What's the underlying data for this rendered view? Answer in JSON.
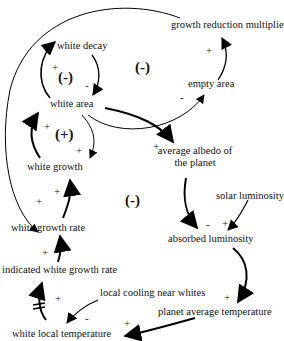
{
  "diagram": {
    "nodes": {
      "growth_reduction_multiplier": "growth reduction multiplier",
      "white_decay": "white decay",
      "empty_area": "empty area",
      "white_area": "white area",
      "average_albedo_line1": "average albedo of",
      "average_albedo_line2": "the planet",
      "white_growth": "white growth",
      "solar_luminosity": "solar luminosity",
      "white_growth_rate": "white growth rate",
      "absorbed_luminosity": "absorbed luminosity",
      "indicated_white_growth_rate": "indicated white growth rate",
      "local_cooling_near_whites": "local cooling near whites",
      "planet_average_temperature": "planet average temperature",
      "white_local_temperature": "white local temperature"
    },
    "loops": {
      "decay_loop": "(-)",
      "empty_area_loop": "(-)",
      "growth_loop": "(+)",
      "albedo_loop": "(-)"
    },
    "signs": {
      "decay_to_white_decay": "+",
      "white_decay_to_area": "-",
      "empty_to_multiplier": "+",
      "area_to_empty": "-",
      "growth_to_area": "+",
      "area_to_growth": "+",
      "area_to_albedo": "+",
      "rate_to_growth": "+",
      "multiplier_to_rate": "+",
      "albedo_to_absorbed": "-",
      "solar_to_absorbed": "+",
      "indicated_to_rate": "+",
      "temp_to_indicated": "+",
      "cooling_to_local": "-",
      "absorbed_to_planet_temp": "+",
      "planet_temp_to_local": "+"
    },
    "delay_marker": "||"
  }
}
